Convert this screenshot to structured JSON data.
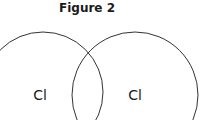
{
  "title": "Figure 2",
  "atoms": [
    {
      "label": "Cl",
      "cx": 43,
      "cy": 92,
      "r": 60
    },
    {
      "label": "Cl",
      "cx": 135,
      "cy": 95,
      "r": 63
    }
  ],
  "colors": {
    "stroke": "#333333",
    "text": "#1a1a1a"
  }
}
